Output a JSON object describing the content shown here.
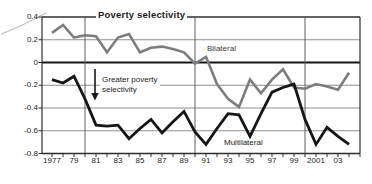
{
  "chart_data": {
    "type": "line",
    "title": "Poverty selectivity",
    "annotation": {
      "line1": "Greater poverty",
      "line2": "selectivity"
    },
    "x_years": [
      1977,
      1978,
      1979,
      1980,
      1981,
      1982,
      1983,
      1984,
      1985,
      1986,
      1987,
      1988,
      1989,
      1990,
      1991,
      1992,
      1993,
      1994,
      1995,
      1996,
      1997,
      1998,
      1999,
      2000,
      2001,
      2002,
      2003,
      2004
    ],
    "x_tick_labels": [
      {
        "year": 1977,
        "label": "1977"
      },
      {
        "year": 1979,
        "label": "79"
      },
      {
        "year": 1981,
        "label": "81"
      },
      {
        "year": 1983,
        "label": "83"
      },
      {
        "year": 1985,
        "label": "85"
      },
      {
        "year": 1987,
        "label": "87"
      },
      {
        "year": 1989,
        "label": "89"
      },
      {
        "year": 1991,
        "label": "91"
      },
      {
        "year": 1993,
        "label": "93"
      },
      {
        "year": 1995,
        "label": "95"
      },
      {
        "year": 1997,
        "label": "97"
      },
      {
        "year": 1999,
        "label": "99"
      },
      {
        "year": 2001,
        "label": "2001"
      },
      {
        "year": 2003,
        "label": "03"
      }
    ],
    "y_ticks": [
      {
        "value": 0.4,
        "label": "0.4"
      },
      {
        "value": 0.2,
        "label": "0.2"
      },
      {
        "value": 0,
        "label": "0"
      },
      {
        "value": -0.2,
        "label": "-0.2"
      },
      {
        "value": -0.4,
        "label": "-0.4"
      },
      {
        "value": -0.6,
        "label": "-0.6"
      },
      {
        "value": -0.8,
        "label": "-0.8"
      }
    ],
    "ylim": [
      -0.8,
      0.4
    ],
    "xlim": [
      1976,
      2005
    ],
    "grid": {
      "horizontal": true,
      "vertical_decade_years": [
        1980,
        1990,
        2000
      ],
      "zero_line_emphasized": true
    },
    "legend_position": "inline-labels",
    "series": [
      {
        "name": "Bilateral",
        "color": "#7d7d7d",
        "width": 2.6,
        "values": [
          0.26,
          0.33,
          0.22,
          0.24,
          0.23,
          0.09,
          0.22,
          0.25,
          0.09,
          0.13,
          0.14,
          0.12,
          0.09,
          -0.01,
          0.05,
          -0.19,
          -0.32,
          -0.39,
          -0.15,
          -0.27,
          -0.15,
          -0.06,
          -0.22,
          -0.23,
          -0.19,
          -0.21,
          -0.24,
          -0.09
        ]
      },
      {
        "name": "Multilateral",
        "color": "#161616",
        "width": 2.8,
        "values": [
          -0.15,
          -0.18,
          -0.12,
          -0.32,
          -0.55,
          -0.56,
          -0.55,
          -0.67,
          -0.58,
          -0.5,
          -0.62,
          -0.52,
          -0.43,
          -0.61,
          -0.72,
          -0.58,
          -0.45,
          -0.46,
          -0.65,
          -0.45,
          -0.26,
          -0.22,
          -0.19,
          -0.5,
          -0.72,
          -0.57,
          -0.65,
          -0.72
        ]
      }
    ],
    "colors": {
      "grid": "#8f8f8f",
      "decade_grid": "#5f5f5f",
      "axis": "#2e2e2e",
      "zero_line": "#161616"
    }
  }
}
